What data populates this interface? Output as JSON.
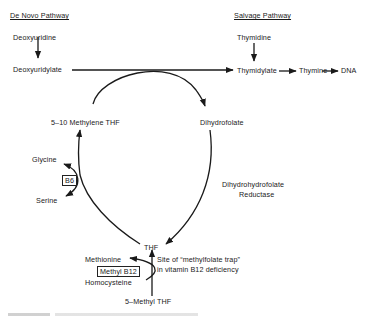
{
  "headers": {
    "de_novo": "De Novo Pathway",
    "salvage": "Salvage Pathway"
  },
  "nodes": {
    "deoxyuridine": "Deoxyuridine",
    "deoxyuridylate": "Deoxyuridylate",
    "thymidine": "Thymidine",
    "thymidylate": "Thymidylate",
    "thymine": "Thymine",
    "dna": "DNA",
    "methylene_thf": "5–10 Methylene THF",
    "dihydrofolate": "Dihydrofolate",
    "thf": "THF",
    "methyl_thf": "5–Methyl THF",
    "glycine": "Glycine",
    "serine": "Serine",
    "methionine": "Methionine",
    "homocysteine": "Homocysteine"
  },
  "cofactors": {
    "b6": "B6",
    "methyl_b12": "Methyl B12"
  },
  "annotations": {
    "reductase_line1": "Dihydrohydrofolate",
    "reductase_line2": "Reductase",
    "trap_line1": "Site of “methylfolate trap”",
    "trap_line2": "in vitamin B12 deficiency"
  },
  "colors": {
    "ink": "#1a1a1a",
    "background": "#ffffff"
  }
}
